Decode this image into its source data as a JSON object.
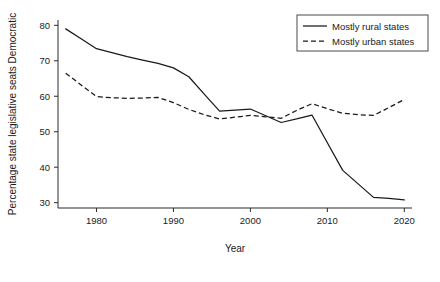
{
  "chart_data": {
    "type": "line",
    "title": "",
    "xlabel": "Year",
    "ylabel": "Percentage state legislative seats Democratic",
    "xlim": [
      1975,
      2021
    ],
    "ylim": [
      28.5,
      81.5
    ],
    "xticks": [
      1980,
      1990,
      2000,
      2010,
      2020
    ],
    "yticks": [
      30,
      40,
      50,
      60,
      70,
      80
    ],
    "xtick_labels": [
      "1980",
      "1990",
      "2000",
      "2010",
      "2020"
    ],
    "ytick_labels": [
      "30",
      "40",
      "50",
      "60",
      "70",
      "80"
    ],
    "grid": false,
    "legend_position": "top-right",
    "x": [
      1976,
      1978,
      1980,
      1982,
      1984,
      1986,
      1988,
      1990,
      1992,
      1994,
      1996,
      1998,
      2000,
      2002,
      2004,
      2006,
      2008,
      2010,
      2012,
      2014,
      2016,
      2018,
      2020
    ],
    "series": [
      {
        "name": "Mostly rural states",
        "style": "solid",
        "color": "#1a1a1a",
        "values": [
          79.0,
          76.2,
          73.4,
          72.3,
          71.2,
          70.2,
          69.3,
          68.0,
          65.5,
          60.6,
          55.8,
          56.1,
          56.4,
          54.5,
          52.6,
          53.6,
          54.7,
          46.9,
          39.1,
          35.3,
          31.5,
          31.2,
          30.8
        ]
      },
      {
        "name": "Mostly urban states",
        "style": "dashed",
        "color": "#1a1a1a",
        "values": [
          66.5,
          63.2,
          59.9,
          59.6,
          59.4,
          59.5,
          59.7,
          58.2,
          56.3,
          54.8,
          53.6,
          54.1,
          54.6,
          54.2,
          53.8,
          56.0,
          57.9,
          56.5,
          55.2,
          54.8,
          54.6,
          56.8,
          59.1
        ]
      }
    ],
    "axis_color": "#2b2b2b"
  },
  "legend": {
    "items": [
      {
        "label": "Mostly rural states",
        "style": "solid"
      },
      {
        "label": "Mostly urban states",
        "style": "dashed"
      }
    ]
  },
  "axes": {
    "x_title": "Year",
    "y_title": "Percentage state legislative seats Democratic"
  }
}
